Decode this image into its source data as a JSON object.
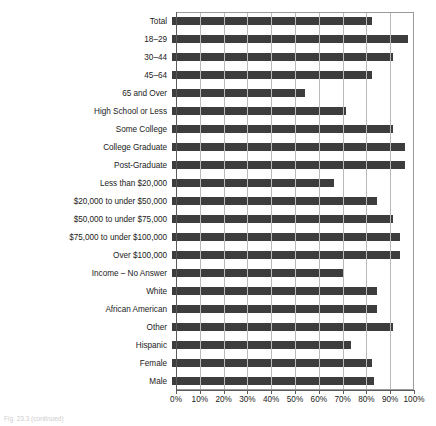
{
  "caption": "Fig. 23.3 (continued)",
  "chart_data": {
    "type": "bar",
    "orientation": "horizontal",
    "title": "",
    "subtitle": "",
    "xlabel": "",
    "ylabel": "",
    "xlim": [
      0,
      100
    ],
    "xtick_labels": [
      "0%",
      "10%",
      "20%",
      "30%",
      "40%",
      "50%",
      "60%",
      "70%",
      "80%",
      "90%",
      "100%"
    ],
    "xticks": [
      0,
      10,
      20,
      30,
      40,
      50,
      60,
      70,
      80,
      90,
      100
    ],
    "grid": "vertical",
    "legend": "none",
    "bar_color": "#3d3d3d",
    "categories": [
      "Total",
      "18–29",
      "30–44",
      "45–64",
      "65 and Over",
      "High School or Less",
      "Some College",
      "College Graduate",
      "Post-Graduate",
      "Less than $20,000",
      "$20,000 to under $50,000",
      "$50,000 to under $75,000",
      "$75,000 to under $100,000",
      "Over $100,000",
      "Income – No Answer",
      "White",
      "African American",
      "Other",
      "Hispanic",
      "Female",
      "Male"
    ],
    "values": [
      84,
      99,
      93,
      84,
      56,
      73,
      93,
      98,
      98,
      68,
      86,
      93,
      96,
      96,
      72,
      86,
      86,
      93,
      75,
      84,
      85
    ]
  }
}
